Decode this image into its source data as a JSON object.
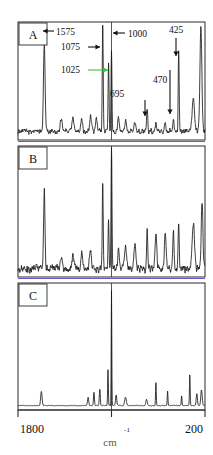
{
  "figure": {
    "background": "#ffffff",
    "trace_color": "#1a1a1a",
    "frame_color": "#2b2b2b",
    "separator_ab_color": "#6a5acd",
    "separator_bc_color": "#6a5acd",
    "green_annotation_color": "#2fcc2f",
    "axis_min_label": "1800",
    "axis_max_label": "200",
    "axis_unit_base": "cm",
    "axis_unit_exponent": "-1"
  },
  "panels": [
    {
      "letter": "A"
    },
    {
      "letter": "B"
    },
    {
      "letter": "C"
    }
  ],
  "annotations": [
    {
      "label": "1575",
      "arrow": "left",
      "color": "#111111"
    },
    {
      "label": "1075",
      "arrow": "right",
      "color": "#111111"
    },
    {
      "label": "1025",
      "arrow": "right",
      "color": "#2fcc2f"
    },
    {
      "label": "1000",
      "arrow": "left",
      "color": "#111111"
    },
    {
      "label": "425",
      "arrow": "down",
      "color": "#111111"
    },
    {
      "label": "470",
      "arrow": "down",
      "color": "#111111"
    },
    {
      "label": "695",
      "arrow": "down",
      "color": "#111111"
    }
  ],
  "chart_data": {
    "type": "line",
    "title": "",
    "xlabel": "cm-1",
    "ylabel": "",
    "xlim": [
      1800,
      200
    ],
    "ylim": [
      0,
      1
    ],
    "grid": false,
    "legend": "none",
    "xticks": [
      1800,
      1000,
      200
    ],
    "xticklabels": [
      "1800",
      "",
      "200"
    ],
    "annotated_peaks": [
      {
        "wavenumber": 1575,
        "panel": "A",
        "label": "1575"
      },
      {
        "wavenumber": 1075,
        "panel": "A",
        "label": "1075"
      },
      {
        "wavenumber": 1025,
        "panel": "A",
        "label": "1025"
      },
      {
        "wavenumber": 1000,
        "panel": "A",
        "label": "1000"
      },
      {
        "wavenumber": 695,
        "panel": "A",
        "label": "695"
      },
      {
        "wavenumber": 470,
        "panel": "A",
        "label": "470"
      },
      {
        "wavenumber": 425,
        "panel": "A",
        "label": "425"
      }
    ],
    "series": [
      {
        "name": "A",
        "peaks": [
          {
            "x": 1575,
            "h": 0.78,
            "w": 7
          },
          {
            "x": 1430,
            "h": 0.1,
            "w": 9
          },
          {
            "x": 1330,
            "h": 0.12,
            "w": 9
          },
          {
            "x": 1255,
            "h": 0.11,
            "w": 8
          },
          {
            "x": 1180,
            "h": 0.13,
            "w": 8
          },
          {
            "x": 1130,
            "h": 0.12,
            "w": 7
          },
          {
            "x": 1075,
            "h": 0.95,
            "w": 4
          },
          {
            "x": 1025,
            "h": 0.62,
            "w": 4
          },
          {
            "x": 1000,
            "h": 0.7,
            "w": 4
          },
          {
            "x": 940,
            "h": 0.12,
            "w": 7
          },
          {
            "x": 880,
            "h": 0.1,
            "w": 8
          },
          {
            "x": 800,
            "h": 0.09,
            "w": 8
          },
          {
            "x": 695,
            "h": 0.22,
            "w": 5
          },
          {
            "x": 620,
            "h": 0.07,
            "w": 7
          },
          {
            "x": 540,
            "h": 0.06,
            "w": 7
          },
          {
            "x": 470,
            "h": 0.12,
            "w": 4
          },
          {
            "x": 425,
            "h": 0.72,
            "w": 4
          },
          {
            "x": 300,
            "h": 0.3,
            "w": 10
          },
          {
            "x": 235,
            "h": 0.95,
            "w": 8
          }
        ],
        "baseline": 0.06,
        "noise": 0.035
      },
      {
        "name": "B",
        "peaks": [
          {
            "x": 1575,
            "h": 0.62,
            "w": 6
          },
          {
            "x": 1430,
            "h": 0.1,
            "w": 9
          },
          {
            "x": 1330,
            "h": 0.11,
            "w": 9
          },
          {
            "x": 1255,
            "h": 0.13,
            "w": 8
          },
          {
            "x": 1180,
            "h": 0.14,
            "w": 8
          },
          {
            "x": 1075,
            "h": 0.7,
            "w": 4
          },
          {
            "x": 1025,
            "h": 0.4,
            "w": 4
          },
          {
            "x": 1000,
            "h": 0.95,
            "w": 4
          },
          {
            "x": 940,
            "h": 0.16,
            "w": 7
          },
          {
            "x": 880,
            "h": 0.18,
            "w": 8
          },
          {
            "x": 800,
            "h": 0.2,
            "w": 8
          },
          {
            "x": 695,
            "h": 0.3,
            "w": 5
          },
          {
            "x": 620,
            "h": 0.26,
            "w": 7
          },
          {
            "x": 540,
            "h": 0.28,
            "w": 7
          },
          {
            "x": 470,
            "h": 0.3,
            "w": 5
          },
          {
            "x": 425,
            "h": 0.34,
            "w": 5
          },
          {
            "x": 300,
            "h": 0.36,
            "w": 10
          },
          {
            "x": 225,
            "h": 0.55,
            "w": 7
          }
        ],
        "baseline": 0.05,
        "noise": 0.045
      },
      {
        "name": "C",
        "peaks": [
          {
            "x": 1600,
            "h": 0.12,
            "w": 6
          },
          {
            "x": 1200,
            "h": 0.07,
            "w": 5
          },
          {
            "x": 1150,
            "h": 0.11,
            "w": 4
          },
          {
            "x": 1100,
            "h": 0.14,
            "w": 4
          },
          {
            "x": 1030,
            "h": 0.3,
            "w": 3
          },
          {
            "x": 1000,
            "h": 0.95,
            "w": 2.5
          },
          {
            "x": 960,
            "h": 0.09,
            "w": 5
          },
          {
            "x": 880,
            "h": 0.07,
            "w": 7
          },
          {
            "x": 700,
            "h": 0.05,
            "w": 6
          },
          {
            "x": 620,
            "h": 0.2,
            "w": 3
          },
          {
            "x": 520,
            "h": 0.12,
            "w": 3
          },
          {
            "x": 400,
            "h": 0.08,
            "w": 3
          },
          {
            "x": 330,
            "h": 0.26,
            "w": 3
          },
          {
            "x": 270,
            "h": 0.1,
            "w": 5
          },
          {
            "x": 230,
            "h": 0.13,
            "w": 6
          }
        ],
        "baseline": 0.02,
        "noise": 0.004
      }
    ]
  }
}
